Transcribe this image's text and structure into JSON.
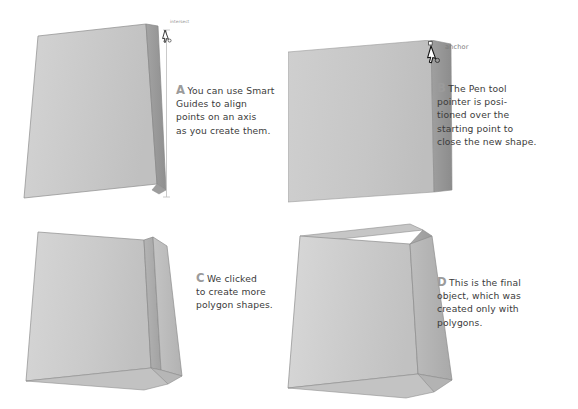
{
  "figure": {
    "background_color": "#ffffff",
    "palette": {
      "front_face": "#c9c9c9",
      "front_face_light": "#d2d2d2",
      "side_face": "#9b9b9b",
      "gusset_face": "#b0b0b0",
      "rim_face": "#a8a8a8",
      "rim_top": "#bdbdbd",
      "outline": "#8a8a8a",
      "guide_line": "#b8b8b8",
      "marker_text": "#9b9b9b",
      "body_text": "#3b3b3b",
      "smart_guide_text": "#8c8c8c"
    }
  },
  "panels": [
    {
      "id": "a",
      "marker": "A",
      "caption": "You can use Smart Guides to align points on an axis as you create them.",
      "smart_guide_label": "intersect",
      "has_guide_line": true,
      "has_pen_cursor": true
    },
    {
      "id": "b",
      "marker": "B",
      "caption": "The Pen tool pointer is posi-tioned over the starting point to close the new shape.",
      "anchor_label": "anchor",
      "has_pen_cursor": true
    },
    {
      "id": "c",
      "marker": "C",
      "caption": "We clicked to create more polygon shapes."
    },
    {
      "id": "d",
      "marker": "D",
      "caption": "This is the final object, which was created only with polygons."
    }
  ],
  "captions": {
    "a": {
      "marker": "A",
      "line1": "You can use Smart",
      "line2": "Guides to align",
      "line3": "points on an axis",
      "line4": "as you create them."
    },
    "b": {
      "marker": "B",
      "line1": "The Pen tool",
      "line2": "pointer is posi-",
      "line3": "tioned over the",
      "line4": "starting point to",
      "line5": "close the new shape."
    },
    "c": {
      "marker": "C",
      "line1": "We clicked",
      "line2": "to create more",
      "line3": "polygon shapes."
    },
    "d": {
      "marker": "D",
      "line1": "This is the final",
      "line2": "object, which was",
      "line3": "created only with",
      "line4": "polygons."
    }
  },
  "labels": {
    "intersect": "intersect",
    "anchor": "anchor"
  }
}
